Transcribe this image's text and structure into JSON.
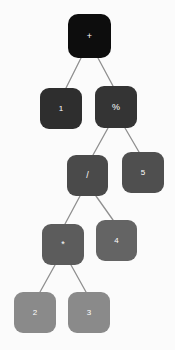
{
  "diagram": {
    "kind": "binary-expression-tree",
    "background_color": "#fbfbfb",
    "edge_color": "#8f8f8f",
    "label_color": "#ffffff",
    "expression": "1 % (((2 * 3) * 4) / 5) + ...",
    "levels": 6,
    "node_count": 10,
    "edge_count": 9
  },
  "nodes": [
    {
      "id": "n0",
      "label": "+",
      "role": "root-operator",
      "depth": 0,
      "x": 68,
      "y": 14,
      "w": 43,
      "h": 44,
      "color": "#0d0d0d",
      "font_size": 9,
      "radius": 10
    },
    {
      "id": "n1",
      "label": "1",
      "role": "operand",
      "depth": 1,
      "x": 40,
      "y": 88,
      "w": 42,
      "h": 41,
      "color": "#2e2e2e",
      "font_size": 8,
      "radius": 9
    },
    {
      "id": "n2",
      "label": "%",
      "role": "operator",
      "depth": 1,
      "x": 95,
      "y": 86,
      "w": 42,
      "h": 42,
      "color": "#343434",
      "font_size": 9,
      "radius": 9
    },
    {
      "id": "n3",
      "label": "/",
      "role": "operator",
      "depth": 2,
      "x": 67,
      "y": 155,
      "w": 41,
      "h": 41,
      "color": "#4a4a4a",
      "font_size": 9,
      "radius": 9
    },
    {
      "id": "n4",
      "label": "5",
      "role": "operand",
      "depth": 2,
      "x": 122,
      "y": 152,
      "w": 42,
      "h": 41,
      "color": "#4f4f4f",
      "font_size": 8,
      "radius": 9
    },
    {
      "id": "n5",
      "label": "*",
      "role": "operator",
      "depth": 3,
      "x": 42,
      "y": 224,
      "w": 42,
      "h": 41,
      "color": "#5c5c5c",
      "font_size": 9,
      "radius": 9
    },
    {
      "id": "n6",
      "label": "4",
      "role": "operand",
      "depth": 3,
      "x": 96,
      "y": 220,
      "w": 41,
      "h": 41,
      "color": "#646464",
      "font_size": 8,
      "radius": 9
    },
    {
      "id": "n7",
      "label": "2",
      "role": "operand",
      "depth": 4,
      "x": 14,
      "y": 292,
      "w": 42,
      "h": 41,
      "color": "#8a8a8a",
      "font_size": 8,
      "radius": 9
    },
    {
      "id": "n8",
      "label": "3",
      "role": "operand",
      "depth": 4,
      "x": 68,
      "y": 292,
      "w": 42,
      "h": 41,
      "color": "#8a8a8a",
      "font_size": 8,
      "radius": 9
    }
  ],
  "edges": [
    {
      "id": "e0",
      "from": "n0",
      "to": "n1",
      "x1": 81,
      "y1": 58,
      "x2": 66,
      "y2": 88
    },
    {
      "id": "e1",
      "from": "n0",
      "to": "n2",
      "x1": 98,
      "y1": 58,
      "x2": 113,
      "y2": 86
    },
    {
      "id": "e2",
      "from": "n2",
      "to": "n3",
      "x1": 108,
      "y1": 128,
      "x2": 93,
      "y2": 155
    },
    {
      "id": "e3",
      "from": "n2",
      "to": "n4",
      "x1": 125,
      "y1": 128,
      "x2": 139,
      "y2": 152
    },
    {
      "id": "e4",
      "from": "n3",
      "to": "n5",
      "x1": 80,
      "y1": 196,
      "x2": 65,
      "y2": 224
    },
    {
      "id": "e5",
      "from": "n3",
      "to": "n6",
      "x1": 96,
      "y1": 196,
      "x2": 113,
      "y2": 220
    },
    {
      "id": "e6",
      "from": "n5",
      "to": "n7",
      "x1": 55,
      "y1": 265,
      "x2": 40,
      "y2": 292
    },
    {
      "id": "e7",
      "from": "n5",
      "to": "n8",
      "x1": 71,
      "y1": 265,
      "x2": 86,
      "y2": 292
    }
  ]
}
